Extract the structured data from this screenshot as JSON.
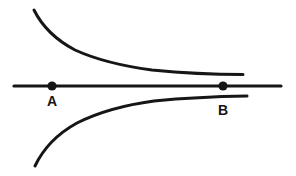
{
  "figure": {
    "background_color": "#ffffff",
    "ink_color": "#161616",
    "line": {
      "x1": 14,
      "y1": 86,
      "x2": 281,
      "y2": 86
    },
    "points": [
      {
        "label": "A",
        "x": 52,
        "y": 86,
        "label_y": 106
      },
      {
        "label": "B",
        "x": 223,
        "y": 86,
        "label_y": 115
      }
    ],
    "curves": {
      "upper": {
        "path": "M 34 10 C 43 28, 56 40, 75 50 C 97 60, 122 66, 152 70 C 182 73, 212 74.5, 243 74.5"
      },
      "lower": {
        "path": "M 35 166 C 44 147, 57 134, 77 123 C 99 112, 124 105, 154 101 C 184 98, 214 96.5, 247 96"
      }
    }
  }
}
